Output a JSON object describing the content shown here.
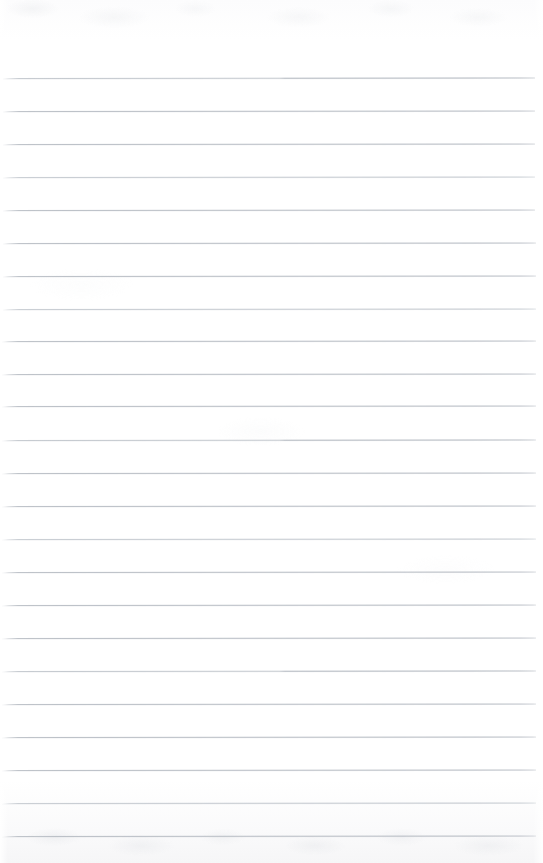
{
  "document": {
    "kind": "ruled-notebook-page",
    "title": "Blank ruled notebook page",
    "content_text": "",
    "is_blank": true,
    "page_number": "",
    "handwriting": []
  },
  "page": {
    "width": 543,
    "height": 863,
    "background_color": "#fefefe",
    "paper_tone_top": "#fcfcfd",
    "paper_tone_bottom": "#f6f6f7"
  },
  "ruling": {
    "line_color": "#b9bec5",
    "line_color_faint": "#c6cbd1",
    "line_color_accent": "#aeb4bc",
    "line_thickness_px": 1,
    "line_count": 24,
    "first_line_y": 78,
    "last_line_y": 836,
    "spacing_px": 33,
    "left_margin_px": 3,
    "right_margin_px": 9,
    "top_margin_px": 78,
    "lines": [
      {
        "y": 78,
        "x1": 3,
        "x2": 535,
        "rotate": -0.05,
        "style": "accent-right"
      },
      {
        "y": 111,
        "x1": 3,
        "x2": 535,
        "rotate": -0.05,
        "style": "normal"
      },
      {
        "y": 144,
        "x1": 3,
        "x2": 535,
        "rotate": -0.05,
        "style": "normal"
      },
      {
        "y": 177,
        "x1": 3,
        "x2": 535,
        "rotate": -0.05,
        "style": "faint"
      },
      {
        "y": 210,
        "x1": 3,
        "x2": 535,
        "rotate": -0.05,
        "style": "normal"
      },
      {
        "y": 243,
        "x1": 3,
        "x2": 536,
        "rotate": -0.05,
        "style": "normal"
      },
      {
        "y": 276,
        "x1": 3,
        "x2": 536,
        "rotate": -0.05,
        "style": "normal"
      },
      {
        "y": 309,
        "x1": 3,
        "x2": 536,
        "rotate": -0.05,
        "style": "faint"
      },
      {
        "y": 341,
        "x1": 2,
        "x2": 536,
        "rotate": -0.05,
        "style": "normal"
      },
      {
        "y": 374,
        "x1": 2,
        "x2": 536,
        "rotate": -0.05,
        "style": "normal"
      },
      {
        "y": 406,
        "x1": 2,
        "x2": 536,
        "rotate": -0.05,
        "style": "normal"
      },
      {
        "y": 440,
        "x1": 2,
        "x2": 536,
        "rotate": -0.05,
        "style": "accent-right"
      },
      {
        "y": 473,
        "x1": 2,
        "x2": 536,
        "rotate": -0.05,
        "style": "normal"
      },
      {
        "y": 506,
        "x1": 2,
        "x2": 536,
        "rotate": -0.05,
        "style": "normal"
      },
      {
        "y": 539,
        "x1": 2,
        "x2": 536,
        "rotate": -0.05,
        "style": "faint"
      },
      {
        "y": 572,
        "x1": 2,
        "x2": 536,
        "rotate": -0.05,
        "style": "normal"
      },
      {
        "y": 605,
        "x1": 2,
        "x2": 536,
        "rotate": -0.05,
        "style": "normal"
      },
      {
        "y": 638,
        "x1": 2,
        "x2": 536,
        "rotate": -0.05,
        "style": "normal"
      },
      {
        "y": 671,
        "x1": 2,
        "x2": 536,
        "rotate": -0.05,
        "style": "accent-right"
      },
      {
        "y": 704,
        "x1": 2,
        "x2": 536,
        "rotate": -0.05,
        "style": "normal"
      },
      {
        "y": 737,
        "x1": 2,
        "x2": 536,
        "rotate": -0.05,
        "style": "normal"
      },
      {
        "y": 770,
        "x1": 2,
        "x2": 536,
        "rotate": -0.05,
        "style": "normal"
      },
      {
        "y": 803,
        "x1": 2,
        "x2": 536,
        "rotate": -0.05,
        "style": "faint"
      },
      {
        "y": 836,
        "x1": 2,
        "x2": 536,
        "rotate": -0.05,
        "style": "normal"
      }
    ]
  }
}
